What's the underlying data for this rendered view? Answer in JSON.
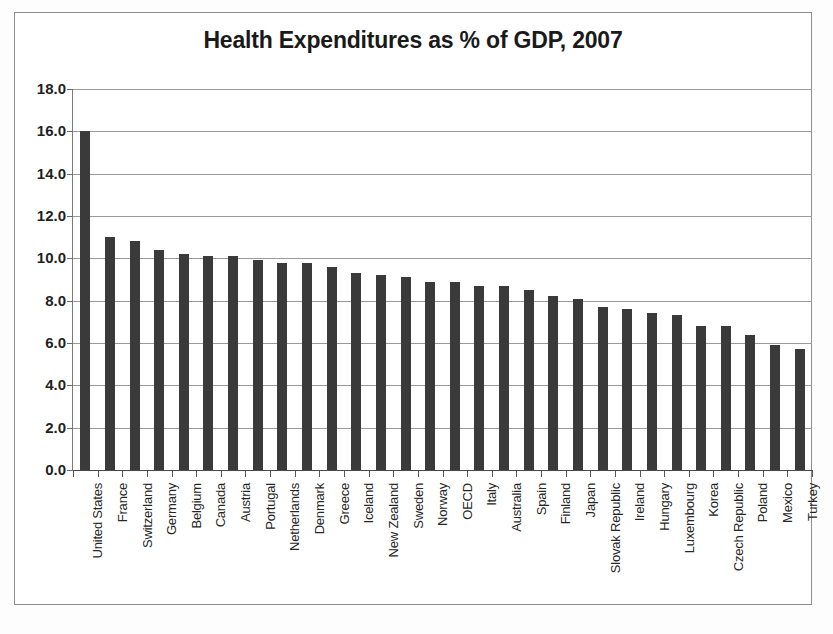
{
  "chart": {
    "title": "Health Expenditures as % of GDP, 2007"
  },
  "chart_data": {
    "type": "bar",
    "title": "Health Expenditures as % of GDP, 2007",
    "xlabel": "",
    "ylabel": "",
    "ylim": [
      0.0,
      18.0
    ],
    "yticks": [
      "0.0",
      "2.0",
      "4.0",
      "6.0",
      "8.0",
      "10.0",
      "12.0",
      "14.0",
      "16.0",
      "18.0"
    ],
    "ytick_values": [
      0.0,
      2.0,
      4.0,
      6.0,
      8.0,
      10.0,
      12.0,
      14.0,
      16.0,
      18.0
    ],
    "grid": true,
    "legend": false,
    "bar_color": "#3a3a3a",
    "categories": [
      "United States",
      "France",
      "Switzerland",
      "Germany",
      "Belgium",
      "Canada",
      "Austria",
      "Portugal",
      "Netherlands",
      "Denmark",
      "Greece",
      "Iceland",
      "New Zealand",
      "Sweden",
      "Norway",
      "OECD",
      "Italy",
      "Australia",
      "Spain",
      "Finland",
      "Japan",
      "Slovak Republic",
      "Ireland",
      "Hungary",
      "Luxembourg",
      "Korea",
      "Czech Republic",
      "Poland",
      "Mexico",
      "Turkey"
    ],
    "values": [
      16.0,
      11.0,
      10.8,
      10.4,
      10.2,
      10.1,
      10.1,
      9.9,
      9.8,
      9.8,
      9.6,
      9.3,
      9.2,
      9.1,
      8.9,
      8.9,
      8.7,
      8.7,
      8.5,
      8.2,
      8.1,
      7.7,
      7.6,
      7.4,
      7.3,
      6.8,
      6.8,
      6.4,
      5.9,
      5.7
    ]
  }
}
